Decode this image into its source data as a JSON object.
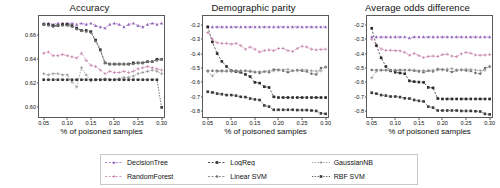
{
  "figure": {
    "xlabel": "% of poisoned samples",
    "xticks": [
      "0.05",
      "0.10",
      "0.15",
      "0.20",
      "0.25",
      "0.30"
    ]
  },
  "legend": {
    "entries": [
      {
        "label": "DecisionTree",
        "color": "#9467bd",
        "marker": "triangle",
        "dash": "2,1.6"
      },
      {
        "label": "LogReg",
        "color": "#2b2b2b",
        "marker": "square",
        "dash": "2,1.6"
      },
      {
        "label": "GaussianNB",
        "color": "#8c8c8c",
        "marker": "plus",
        "dash": "1.4,1.4"
      },
      {
        "label": "RandomForest",
        "color": "#c47ba8",
        "marker": "plus",
        "dash": "2,1.6"
      },
      {
        "label": "Linear SVM",
        "color": "#6f6f6f",
        "marker": "dot",
        "dash": "2,1.6"
      },
      {
        "label": "RBF SVM",
        "color": "#3a3a3a",
        "marker": "square",
        "dash": "1.4,1.4"
      }
    ]
  },
  "chart_data": [
    {
      "type": "line",
      "title": "Accuracy",
      "xlabel": "% of poisoned samples",
      "ylabel": "",
      "xlim": [
        0.04,
        0.305
      ],
      "ylim": [
        0.592,
        0.676
      ],
      "grid": false,
      "legend_position": "below-figure",
      "yticks": [
        0.6,
        0.62,
        0.64,
        0.66
      ],
      "ytick_labels": [
        "0.60",
        "0.62",
        "0.64",
        "0.66"
      ],
      "x": [
        0.05,
        0.06,
        0.07,
        0.08,
        0.09,
        0.1,
        0.11,
        0.12,
        0.13,
        0.14,
        0.15,
        0.16,
        0.17,
        0.18,
        0.19,
        0.2,
        0.21,
        0.22,
        0.23,
        0.24,
        0.25,
        0.26,
        0.27,
        0.28,
        0.29,
        0.3
      ],
      "series": [
        {
          "name": "DecisionTree",
          "values": [
            0.67,
            0.67,
            0.669,
            0.67,
            0.67,
            0.67,
            0.67,
            0.669,
            0.67,
            0.669,
            0.67,
            0.668,
            0.667,
            0.666,
            0.669,
            0.67,
            0.669,
            0.667,
            0.669,
            0.67,
            0.668,
            0.667,
            0.669,
            0.67,
            0.669,
            0.67
          ]
        },
        {
          "name": "RandomForest",
          "values": [
            0.645,
            0.646,
            0.643,
            0.643,
            0.644,
            0.643,
            0.642,
            0.641,
            0.645,
            0.639,
            0.635,
            0.634,
            0.631,
            0.628,
            0.63,
            0.629,
            0.629,
            0.63,
            0.629,
            0.63,
            0.632,
            0.633,
            0.634,
            0.633,
            0.632,
            0.631
          ]
        },
        {
          "name": "LogReg",
          "values": [
            0.669,
            0.669,
            0.668,
            0.668,
            0.669,
            0.669,
            0.668,
            0.666,
            0.664,
            0.664,
            0.663,
            0.656,
            0.648,
            0.637,
            0.636,
            0.636,
            0.636,
            0.636,
            0.636,
            0.637,
            0.637,
            0.637,
            0.638,
            0.638,
            0.64,
            0.64
          ]
        },
        {
          "name": "Linear SVM",
          "values": [
            0.669,
            0.668,
            0.667,
            0.668,
            0.668,
            0.668,
            0.667,
            0.665,
            0.664,
            0.663,
            0.662,
            0.655,
            0.647,
            0.637,
            0.636,
            0.636,
            0.636,
            0.636,
            0.636,
            0.636,
            0.637,
            0.637,
            0.638,
            0.638,
            0.639,
            0.64
          ]
        },
        {
          "name": "GaussianNB",
          "values": [
            0.628,
            0.627,
            0.628,
            0.628,
            0.627,
            0.627,
            0.621,
            0.617,
            0.633,
            0.627,
            0.622,
            0.623,
            0.623,
            0.624,
            0.623,
            0.623,
            0.624,
            0.625,
            0.625,
            0.626,
            0.628,
            0.629,
            0.63,
            0.631,
            0.63,
            0.628
          ]
        },
        {
          "name": "RBF SVM",
          "values": [
            0.623,
            0.623,
            0.623,
            0.623,
            0.623,
            0.623,
            0.623,
            0.623,
            0.623,
            0.623,
            0.623,
            0.623,
            0.623,
            0.623,
            0.623,
            0.623,
            0.623,
            0.623,
            0.623,
            0.623,
            0.623,
            0.623,
            0.623,
            0.623,
            0.623,
            0.6
          ]
        }
      ]
    },
    {
      "type": "line",
      "title": "Demographic parity",
      "xlabel": "% of poisoned samples",
      "ylabel": "",
      "xlim": [
        0.04,
        0.305
      ],
      "ylim": [
        -0.84,
        -0.14
      ],
      "grid": false,
      "legend_position": "below-figure",
      "yticks": [
        -0.2,
        -0.3,
        -0.4,
        -0.5,
        -0.6,
        -0.7,
        -0.8
      ],
      "ytick_labels": [
        "-0.2",
        "-0.3",
        "-0.4",
        "-0.5",
        "-0.6",
        "-0.7",
        "-0.8"
      ],
      "x": [
        0.05,
        0.06,
        0.07,
        0.08,
        0.09,
        0.1,
        0.11,
        0.12,
        0.13,
        0.14,
        0.15,
        0.16,
        0.17,
        0.18,
        0.19,
        0.2,
        0.21,
        0.22,
        0.23,
        0.24,
        0.25,
        0.26,
        0.27,
        0.28,
        0.29,
        0.3
      ],
      "series": [
        {
          "name": "DecisionTree",
          "values": [
            -0.215,
            -0.215,
            -0.215,
            -0.215,
            -0.215,
            -0.215,
            -0.215,
            -0.215,
            -0.215,
            -0.215,
            -0.215,
            -0.215,
            -0.215,
            -0.215,
            -0.215,
            -0.215,
            -0.215,
            -0.215,
            -0.215,
            -0.215,
            -0.215,
            -0.215,
            -0.215,
            -0.215,
            -0.215,
            -0.215
          ]
        },
        {
          "name": "RandomForest",
          "values": [
            -0.255,
            -0.3,
            -0.325,
            -0.33,
            -0.33,
            -0.335,
            -0.33,
            -0.345,
            -0.37,
            -0.355,
            -0.37,
            -0.39,
            -0.38,
            -0.375,
            -0.38,
            -0.365,
            -0.365,
            -0.38,
            -0.385,
            -0.365,
            -0.35,
            -0.355,
            -0.37,
            -0.375,
            -0.372,
            -0.37
          ]
        },
        {
          "name": "LogReg",
          "values": [
            -0.215,
            -0.32,
            -0.4,
            -0.455,
            -0.49,
            -0.52,
            -0.525,
            -0.53,
            -0.545,
            -0.56,
            -0.6,
            -0.605,
            -0.63,
            -0.635,
            -0.7,
            -0.705,
            -0.705,
            -0.705,
            -0.705,
            -0.705,
            -0.705,
            -0.705,
            -0.705,
            -0.705,
            -0.705,
            -0.705
          ]
        },
        {
          "name": "Linear SVM",
          "values": [
            -0.52,
            -0.52,
            -0.52,
            -0.52,
            -0.52,
            -0.52,
            -0.52,
            -0.52,
            -0.52,
            -0.525,
            -0.53,
            -0.535,
            -0.525,
            -0.53,
            -0.51,
            -0.512,
            -0.52,
            -0.53,
            -0.52,
            -0.515,
            -0.52,
            -0.525,
            -0.54,
            -0.545,
            -0.5,
            -0.495
          ]
        },
        {
          "name": "GaussianNB",
          "values": [
            -0.525,
            -0.555,
            -0.525,
            -0.525,
            -0.525,
            -0.525,
            -0.52,
            -0.525,
            -0.52,
            -0.52,
            -0.525,
            -0.525,
            -0.525,
            -0.52,
            -0.52,
            -0.518,
            -0.512,
            -0.51,
            -0.518,
            -0.52,
            -0.512,
            -0.515,
            -0.52,
            -0.522,
            -0.52,
            -0.49
          ]
        },
        {
          "name": "RBF SVM",
          "values": [
            -0.665,
            -0.67,
            -0.678,
            -0.682,
            -0.688,
            -0.688,
            -0.692,
            -0.7,
            -0.702,
            -0.712,
            -0.718,
            -0.722,
            -0.76,
            -0.768,
            -0.79,
            -0.79,
            -0.79,
            -0.79,
            -0.79,
            -0.792,
            -0.792,
            -0.792,
            -0.795,
            -0.798,
            -0.815,
            -0.818
          ]
        }
      ]
    },
    {
      "type": "line",
      "title": "Average odds difference",
      "xlabel": "% of poisoned samples",
      "ylabel": "",
      "xlim": [
        0.04,
        0.305
      ],
      "ylim": [
        -0.84,
        -0.14
      ],
      "grid": false,
      "legend_position": "below-figure",
      "yticks": [
        -0.2,
        -0.3,
        -0.4,
        -0.5,
        -0.6,
        -0.7,
        -0.8
      ],
      "ytick_labels": [
        "-0.2",
        "-0.3",
        "-0.4",
        "-0.5",
        "-0.6",
        "-0.7",
        "-0.8"
      ],
      "x": [
        0.05,
        0.06,
        0.07,
        0.08,
        0.09,
        0.1,
        0.11,
        0.12,
        0.13,
        0.14,
        0.15,
        0.16,
        0.17,
        0.18,
        0.19,
        0.2,
        0.21,
        0.22,
        0.23,
        0.24,
        0.25,
        0.26,
        0.27,
        0.28,
        0.29,
        0.3
      ],
      "series": [
        {
          "name": "DecisionTree",
          "values": [
            -0.285,
            -0.285,
            -0.285,
            -0.285,
            -0.285,
            -0.285,
            -0.285,
            -0.285,
            -0.292,
            -0.285,
            -0.285,
            -0.285,
            -0.285,
            -0.285,
            -0.285,
            -0.285,
            -0.285,
            -0.285,
            -0.285,
            -0.285,
            -0.285,
            -0.285,
            -0.285,
            -0.285,
            -0.285,
            -0.285
          ]
        },
        {
          "name": "RandomForest",
          "values": [
            -0.3,
            -0.345,
            -0.368,
            -0.378,
            -0.378,
            -0.38,
            -0.382,
            -0.392,
            -0.412,
            -0.4,
            -0.415,
            -0.428,
            -0.42,
            -0.418,
            -0.42,
            -0.408,
            -0.405,
            -0.418,
            -0.422,
            -0.402,
            -0.392,
            -0.398,
            -0.41,
            -0.412,
            -0.41,
            -0.408
          ]
        },
        {
          "name": "LogReg",
          "values": [
            -0.225,
            -0.345,
            -0.43,
            -0.49,
            -0.52,
            -0.53,
            -0.535,
            -0.54,
            -0.59,
            -0.595,
            -0.598,
            -0.6,
            -0.635,
            -0.638,
            -0.712,
            -0.715,
            -0.715,
            -0.715,
            -0.715,
            -0.715,
            -0.715,
            -0.715,
            -0.715,
            -0.715,
            -0.715,
            -0.715
          ]
        },
        {
          "name": "Linear SVM",
          "values": [
            -0.515,
            -0.515,
            -0.515,
            -0.515,
            -0.515,
            -0.515,
            -0.515,
            -0.515,
            -0.515,
            -0.52,
            -0.525,
            -0.53,
            -0.52,
            -0.525,
            -0.508,
            -0.51,
            -0.518,
            -0.528,
            -0.518,
            -0.512,
            -0.518,
            -0.522,
            -0.535,
            -0.54,
            -0.5,
            -0.492
          ]
        },
        {
          "name": "GaussianNB",
          "values": [
            -0.568,
            -0.522,
            -0.518,
            -0.518,
            -0.518,
            -0.518,
            -0.515,
            -0.518,
            -0.515,
            -0.515,
            -0.518,
            -0.518,
            -0.518,
            -0.515,
            -0.515,
            -0.513,
            -0.508,
            -0.505,
            -0.513,
            -0.515,
            -0.508,
            -0.51,
            -0.515,
            -0.518,
            -0.515,
            -0.488
          ]
        },
        {
          "name": "RBF SVM",
          "values": [
            -0.672,
            -0.678,
            -0.688,
            -0.692,
            -0.698,
            -0.698,
            -0.702,
            -0.71,
            -0.712,
            -0.722,
            -0.728,
            -0.732,
            -0.768,
            -0.775,
            -0.795,
            -0.795,
            -0.795,
            -0.795,
            -0.795,
            -0.798,
            -0.798,
            -0.798,
            -0.8,
            -0.802,
            -0.818,
            -0.822
          ]
        }
      ]
    }
  ]
}
